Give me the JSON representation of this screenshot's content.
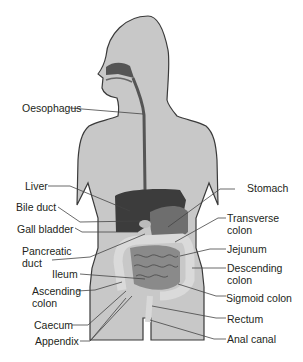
{
  "diagram": {
    "type": "human digestive system",
    "colors": {
      "body_fill": "#c8c8c8",
      "body_outline": "#3a3a3a",
      "liver": "#3a3a3a",
      "intestine": "#8a8a8a",
      "colon": "#d8d8d8",
      "label_text": "#231f20",
      "leader_line": "#444444"
    },
    "labels_left": [
      {
        "id": "oesophagus",
        "text": "Oesophagus"
      },
      {
        "id": "liver",
        "text": "Liver"
      },
      {
        "id": "bile-duct",
        "text": "Bile duct"
      },
      {
        "id": "gall-bladder",
        "text": "Gall bladder"
      },
      {
        "id": "pancreatic-duct",
        "line1": "Pancreatic",
        "line2": "duct"
      },
      {
        "id": "ileum",
        "text": "Ileum"
      },
      {
        "id": "ascending-colon",
        "line1": "Ascending",
        "line2": "colon"
      },
      {
        "id": "caecum",
        "text": "Caecum"
      },
      {
        "id": "appendix",
        "text": "Appendix"
      }
    ],
    "labels_right": [
      {
        "id": "stomach",
        "text": "Stomach"
      },
      {
        "id": "transverse-colon",
        "line1": "Transverse",
        "line2": "colon"
      },
      {
        "id": "jejunum",
        "text": "Jejunum"
      },
      {
        "id": "descending-colon",
        "line1": "Descending",
        "line2": "colon"
      },
      {
        "id": "sigmoid-colon",
        "text": "Sigmoid colon"
      },
      {
        "id": "rectum",
        "text": "Rectum"
      },
      {
        "id": "anal-canal",
        "text": "Anal canal"
      }
    ]
  }
}
